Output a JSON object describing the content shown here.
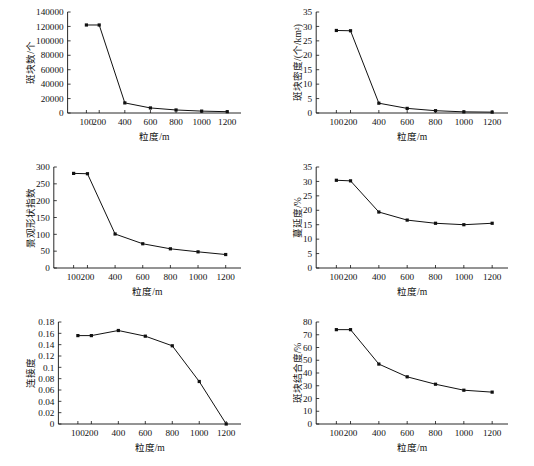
{
  "figure": {
    "panel_count": 6,
    "layout": "2 columns x 3 rows",
    "shared_xlabel": "粒度/m",
    "x_tick_labels": [
      "100",
      "200",
      "400",
      "600",
      "800",
      "1000",
      "1200"
    ]
  },
  "chart_data": [
    {
      "type": "line",
      "panel": "top-left",
      "title": "",
      "xlabel": "粒度/m",
      "ylabel": "斑块数/个",
      "x": [
        100,
        200,
        400,
        600,
        800,
        1000,
        1200
      ],
      "values": [
        122000,
        122000,
        14000,
        7000,
        4200,
        2600,
        1800
      ],
      "xtick_labels": [
        "100",
        "200",
        "400",
        "600",
        "800",
        "1000",
        "1200"
      ],
      "ytick_labels": [
        "0",
        "20000",
        "40000",
        "60000",
        "80000",
        "100000",
        "120000",
        "140000"
      ],
      "ytick_values": [
        0,
        20000,
        40000,
        60000,
        80000,
        100000,
        120000,
        140000
      ],
      "ylim": [
        0,
        140000
      ],
      "grid": false,
      "legend": "none",
      "marker": "square"
    },
    {
      "type": "line",
      "panel": "top-right",
      "title": "",
      "xlabel": "粒度/m",
      "ylabel": "斑块密度/(个/km²)",
      "x": [
        100,
        200,
        400,
        600,
        800,
        1000,
        1200
      ],
      "values": [
        28.6,
        28.5,
        3.4,
        1.6,
        0.8,
        0.4,
        0.3
      ],
      "xtick_labels": [
        "100",
        "200",
        "400",
        "600",
        "800",
        "1000",
        "1200"
      ],
      "ytick_labels": [
        "0",
        "5",
        "10",
        "15",
        "20",
        "25",
        "30",
        "35"
      ],
      "ytick_values": [
        0,
        5,
        10,
        15,
        20,
        25,
        30,
        35
      ],
      "ylim": [
        0,
        35
      ],
      "grid": false,
      "legend": "none",
      "marker": "square"
    },
    {
      "type": "line",
      "panel": "middle-left",
      "title": "",
      "xlabel": "粒度/m",
      "ylabel": "景观形状指数",
      "x": [
        100,
        200,
        400,
        600,
        800,
        1000,
        1200
      ],
      "values": [
        281,
        280,
        101,
        72,
        57,
        48,
        40
      ],
      "xtick_labels": [
        "100",
        "200",
        "400",
        "600",
        "800",
        "1000",
        "1200"
      ],
      "ytick_labels": [
        "0",
        "50",
        "100",
        "150",
        "200",
        "250",
        "300"
      ],
      "ytick_values": [
        0,
        50,
        100,
        150,
        200,
        250,
        300
      ],
      "ylim": [
        0,
        300
      ],
      "grid": false,
      "legend": "none",
      "marker": "square"
    },
    {
      "type": "line",
      "panel": "middle-right",
      "title": "",
      "xlabel": "粒度/m",
      "ylabel": "蔓延度/%",
      "x": [
        100,
        200,
        400,
        600,
        800,
        1000,
        1200
      ],
      "values": [
        30.4,
        30.2,
        19.4,
        16.6,
        15.5,
        15.0,
        15.5
      ],
      "xtick_labels": [
        "100",
        "200",
        "400",
        "600",
        "800",
        "1000",
        "1200"
      ],
      "ytick_labels": [
        "0",
        "5",
        "10",
        "15",
        "20",
        "25",
        "30",
        "35"
      ],
      "ytick_values": [
        0,
        5,
        10,
        15,
        20,
        25,
        30,
        35
      ],
      "ylim": [
        0,
        35
      ],
      "grid": false,
      "legend": "none",
      "marker": "square"
    },
    {
      "type": "line",
      "panel": "bottom-left",
      "title": "",
      "xlabel": "粒度/m",
      "ylabel": "连接度",
      "x": [
        100,
        200,
        400,
        600,
        800,
        1000,
        1200
      ],
      "values": [
        0.156,
        0.156,
        0.165,
        0.155,
        0.138,
        0.075,
        0.0
      ],
      "xtick_labels": [
        "100",
        "200",
        "400",
        "600",
        "800",
        "1000",
        "1200"
      ],
      "ytick_labels": [
        "0",
        "0.02",
        "0.04",
        "0.06",
        "0.08",
        "0.1",
        "0.12",
        "0.14",
        "0.16",
        "0.18"
      ],
      "ytick_values": [
        0,
        0.02,
        0.04,
        0.06,
        0.08,
        0.1,
        0.12,
        0.14,
        0.16,
        0.18
      ],
      "ylim": [
        0,
        0.18
      ],
      "grid": false,
      "legend": "none",
      "marker": "square"
    },
    {
      "type": "line",
      "panel": "bottom-right",
      "title": "",
      "xlabel": "粒度/m",
      "ylabel": "斑块结合度/%",
      "x": [
        100,
        200,
        400,
        600,
        800,
        1000,
        1200
      ],
      "values": [
        74.0,
        74.0,
        47.0,
        37.0,
        31.2,
        26.5,
        25.0
      ],
      "xtick_labels": [
        "100",
        "200",
        "400",
        "600",
        "800",
        "1000",
        "1200"
      ],
      "ytick_labels": [
        "0",
        "10",
        "20",
        "30",
        "40",
        "50",
        "60",
        "70",
        "80"
      ],
      "ytick_values": [
        0,
        10,
        20,
        30,
        40,
        50,
        60,
        70,
        80
      ],
      "ylim": [
        0,
        80
      ],
      "grid": false,
      "legend": "none",
      "marker": "square"
    }
  ]
}
